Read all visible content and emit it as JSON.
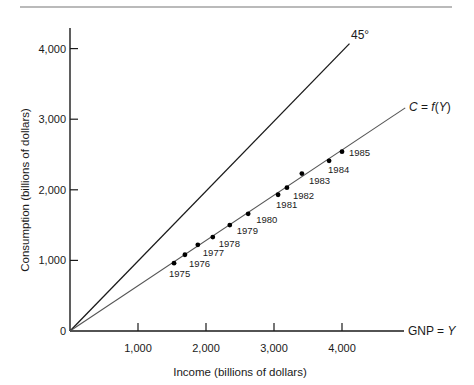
{
  "chart_data": {
    "type": "line",
    "title": "",
    "xlabel": "Income (billions of dollars)",
    "ylabel": "Consumption (billions of dollars)",
    "xlim": [
      0,
      4800
    ],
    "ylim": [
      0,
      4300
    ],
    "x_ticks": [
      1000,
      2000,
      3000,
      4000
    ],
    "x_tick_labels": [
      "1,000",
      "2,000",
      "3,000",
      "4,000"
    ],
    "y_ticks": [
      0,
      1000,
      2000,
      3000,
      4000
    ],
    "y_tick_labels": [
      "0",
      "1,000",
      "2,000",
      "3,000",
      "4,000"
    ],
    "x_axis_end_label": "GNP = Y",
    "grid": false,
    "legend": null,
    "series": [
      {
        "name": "45° line",
        "label": "45°",
        "kind": "line",
        "x": [
          0,
          4110
        ],
        "y": [
          0,
          4070
        ]
      },
      {
        "name": "Consumption function",
        "label": "C = f(Y)",
        "kind": "line",
        "x": [
          0,
          4930
        ],
        "y": [
          0,
          3160
        ]
      },
      {
        "name": "Annual observations",
        "kind": "scatter",
        "points": [
          {
            "year": "1975",
            "x": 1530,
            "y": 960
          },
          {
            "year": "1976",
            "x": 1690,
            "y": 1080
          },
          {
            "year": "1977",
            "x": 1880,
            "y": 1220
          },
          {
            "year": "1978",
            "x": 2100,
            "y": 1330
          },
          {
            "year": "1979",
            "x": 2350,
            "y": 1500
          },
          {
            "year": "1980",
            "x": 2620,
            "y": 1660
          },
          {
            "year": "1981",
            "x": 3060,
            "y": 1930
          },
          {
            "year": "1982",
            "x": 3190,
            "y": 2030
          },
          {
            "year": "1983",
            "x": 3410,
            "y": 2230
          },
          {
            "year": "1984",
            "x": 3810,
            "y": 2410
          },
          {
            "year": "1985",
            "x": 4000,
            "y": 2540
          }
        ]
      }
    ],
    "annotations": [
      "45°",
      "C = f(Y)",
      "GNP = Y"
    ]
  },
  "labels": {
    "xlabel": "Income (billions of dollars)",
    "ylabel": "Consumption (billions of dollars)",
    "line45": "45°",
    "cfunc_c": "C",
    "cfunc_eq": " = ",
    "cfunc_f": "f",
    "cfunc_paren_open": "(",
    "cfunc_y": "Y",
    "cfunc_paren_close": ")",
    "gnp": "GNP = ",
    "gnp_y": "Y"
  },
  "colors": {
    "axis": "#1a1a1a",
    "line45": "#1a1a1a",
    "cfunc": "#555555",
    "points": "#000000",
    "rule": "#777777"
  }
}
